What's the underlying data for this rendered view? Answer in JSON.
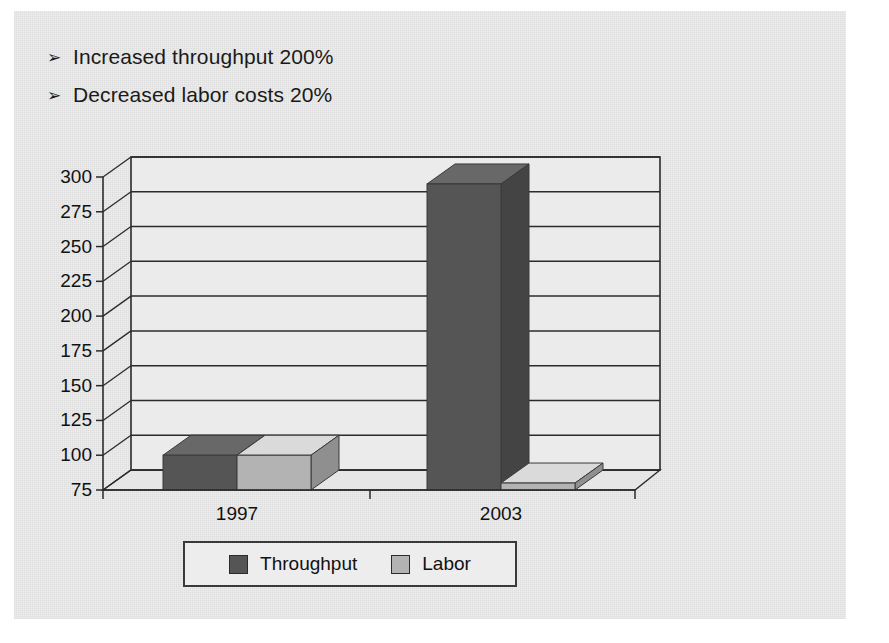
{
  "slide": {
    "bullets": [
      {
        "marker": "➢",
        "text": "Increased throughput 200%"
      },
      {
        "marker": "➢",
        "text": "Decreased labor costs 20%"
      }
    ]
  },
  "chart_data": {
    "type": "bar",
    "title": "",
    "xlabel": "",
    "ylabel": "",
    "categories": [
      "1997",
      "2003"
    ],
    "series": [
      {
        "name": "Throughput",
        "values": [
          100,
          295
        ],
        "color": "#555555"
      },
      {
        "name": "Labor",
        "values": [
          100,
          80
        ],
        "color": "#b3b3b3"
      }
    ],
    "ylim": [
      75,
      300
    ],
    "yticks": [
      300,
      275,
      250,
      225,
      200,
      175,
      150,
      125,
      100,
      75
    ],
    "ytick_labels": [
      "300",
      "275",
      "250",
      "225",
      "200",
      "175",
      "150",
      "125",
      "100",
      "75"
    ],
    "grid": true,
    "legend_position": "bottom",
    "style": "3d-clustered-column"
  },
  "legend": {
    "items": [
      {
        "label": "Throughput",
        "color": "#555555"
      },
      {
        "label": "Labor",
        "color": "#b3b3b3"
      }
    ]
  },
  "colors": {
    "throughput": "#555555",
    "labor": "#b3b3b3",
    "axis": "#2b2b2b",
    "panel_background": "#ededed",
    "floor": "#e6e6e6",
    "wall": "#ebebeb"
  }
}
